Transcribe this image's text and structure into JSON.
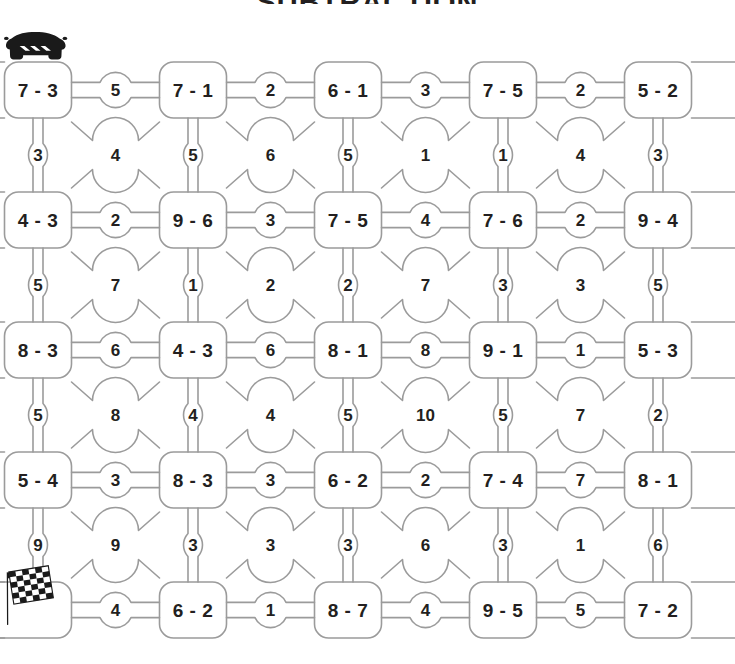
{
  "page": {
    "title": "SUBTRACTION",
    "background_color": "#ffffff",
    "line_color": "#9b9b9b",
    "text_color": "#231f20"
  },
  "icons": {
    "start": {
      "name": "car-icon",
      "label": "Start"
    },
    "finish": {
      "name": "checkered-flag-icon",
      "label": "Finish"
    }
  },
  "maze": {
    "rows": 5,
    "problem_columns": 5,
    "problem_rows": [
      {
        "index": 0,
        "problems": [
          "7 - 3",
          "7 - 1",
          "6 - 1",
          "7 - 5",
          "5 - 2"
        ],
        "horizontal_answers": [
          "5",
          "2",
          "3",
          "2"
        ]
      },
      {
        "index": 1,
        "problems": [
          "4 - 3",
          "9 - 6",
          "7 - 5",
          "7 - 6",
          "9 - 4"
        ],
        "horizontal_answers": [
          "2",
          "3",
          "4",
          "2"
        ]
      },
      {
        "index": 2,
        "problems": [
          "8 - 3",
          "4 - 3",
          "8 - 1",
          "9 - 1",
          "5 - 3"
        ],
        "horizontal_answers": [
          "6",
          "6",
          "8",
          "1"
        ]
      },
      {
        "index": 3,
        "problems": [
          "5 - 4",
          "8 - 3",
          "6 - 2",
          "7 - 4",
          "8 - 1"
        ],
        "horizontal_answers": [
          "3",
          "3",
          "2",
          "7"
        ]
      },
      {
        "index": 4,
        "problems": [
          "",
          "6 - 2",
          "8 - 7",
          "9 - 5",
          "7 - 2"
        ],
        "horizontal_answers": [
          "4",
          "1",
          "4",
          "5"
        ]
      }
    ],
    "connector_rows": [
      {
        "index": 0,
        "answers": [
          "3",
          "4",
          "5",
          "6",
          "5",
          "1",
          "1",
          "4",
          "3"
        ]
      },
      {
        "index": 1,
        "answers": [
          "5",
          "7",
          "1",
          "2",
          "2",
          "7",
          "3",
          "3",
          "5"
        ]
      },
      {
        "index": 2,
        "answers": [
          "5",
          "8",
          "4",
          "4",
          "5",
          "10",
          "5",
          "7",
          "2"
        ]
      },
      {
        "index": 3,
        "answers": [
          "9",
          "9",
          "3",
          "3",
          "3",
          "6",
          "3",
          "1",
          "6"
        ]
      }
    ]
  }
}
